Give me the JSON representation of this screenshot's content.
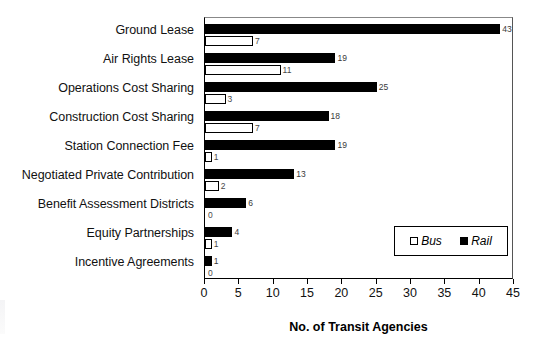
{
  "chart_data": {
    "type": "bar",
    "orientation": "horizontal",
    "title": "",
    "xlabel": "No. of Transit Agencies",
    "ylabel": "",
    "xlim": [
      0,
      45
    ],
    "xticks": [
      0,
      5,
      10,
      15,
      20,
      25,
      30,
      35,
      40,
      45
    ],
    "grid": false,
    "legend_position": "inside-lower-right",
    "categories": [
      "Ground Lease",
      "Air Rights Lease",
      "Operations Cost Sharing",
      "Construction Cost Sharing",
      "Station Connection Fee",
      "Negotiated Private Contribution",
      "Benefit Assessment Districts",
      "Equity Partnerships",
      "Incentive Agreements"
    ],
    "series": [
      {
        "name": "Rail",
        "color": "#000000",
        "style": "filled",
        "values": [
          43,
          19,
          25,
          18,
          19,
          13,
          6,
          4,
          1
        ]
      },
      {
        "name": "Bus",
        "color": "#ffffff",
        "style": "open",
        "values": [
          7,
          11,
          3,
          7,
          1,
          2,
          0,
          1,
          0
        ]
      }
    ]
  },
  "legend": {
    "items": [
      {
        "label": "Bus",
        "swatch": "open-square"
      },
      {
        "label": "Rail",
        "swatch": "filled-square"
      }
    ]
  }
}
